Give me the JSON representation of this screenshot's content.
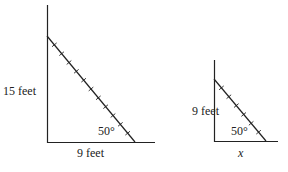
{
  "figures": [
    {
      "id": "large-triangle",
      "height_label": "15 feet",
      "base_label": "9 feet",
      "angle_label": "50°",
      "ticks": 11
    },
    {
      "id": "small-triangle",
      "height_label": "9 feet",
      "base_label": "x",
      "angle_label": "50°",
      "ticks": 6
    }
  ],
  "colors": {
    "stroke": "#222222",
    "background": "#ffffff"
  }
}
